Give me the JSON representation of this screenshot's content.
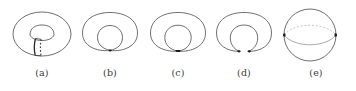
{
  "figure": {
    "type": "topology-deformation-sequence",
    "background_color": "#ffffff",
    "stroke_color": "#444444",
    "faint_stroke_color": "#b8b8b8",
    "accent_color": "#1a1a1a",
    "label_color": "#3a3a3a",
    "panels": [
      {
        "label": "(a)",
        "name": "torus-with-cut",
        "center_x": 42,
        "shape": "torus",
        "outer": {
          "cx": 42,
          "cy": 30,
          "rx": 29,
          "ry": 22
        },
        "inner_hole": {
          "cx": 42,
          "cy": 30,
          "rx": 12,
          "ry": 7
        },
        "cut_band": {
          "x_solid": 35,
          "x_dashed": 41,
          "y_top": 33,
          "y_bottom": 51
        },
        "has_dashed_cut": true
      },
      {
        "label": "(b)",
        "name": "pinched-torus-one-point",
        "center_x": 110,
        "shape": "loop-in-loop",
        "outer": {
          "cx": 110,
          "cy": 30,
          "rx": 27,
          "ry": 22
        },
        "inner_hole": {
          "cx": 111,
          "cy": 33,
          "rx": 13,
          "ry": 12
        },
        "contact_points": 1
      },
      {
        "label": "(c)",
        "name": "pinched-torus-flattening",
        "center_x": 178,
        "shape": "loop-in-loop",
        "outer": {
          "cx": 178,
          "cy": 30,
          "rx": 27,
          "ry": 22
        },
        "inner_hole": {
          "cx": 179,
          "cy": 33,
          "rx": 13,
          "ry": 12
        },
        "contact_points": 1
      },
      {
        "label": "(d)",
        "name": "pinched-torus-two-points",
        "center_x": 244,
        "shape": "loop-in-loop-split",
        "outer": {
          "cx": 244,
          "cy": 30,
          "rx": 27,
          "ry": 22
        },
        "inner_hole": {
          "cx": 245,
          "cy": 33,
          "rx": 14,
          "ry": 12
        },
        "contact_points": 2
      },
      {
        "label": "(e)",
        "name": "sphere-with-equator",
        "center_x": 310,
        "shape": "sphere",
        "outer": {
          "cx": 310,
          "cy": 31,
          "rx": 26,
          "ry": 26
        },
        "equator_front_solid": true,
        "equator_back_dashed": true,
        "pole_dots": 2
      }
    ]
  }
}
